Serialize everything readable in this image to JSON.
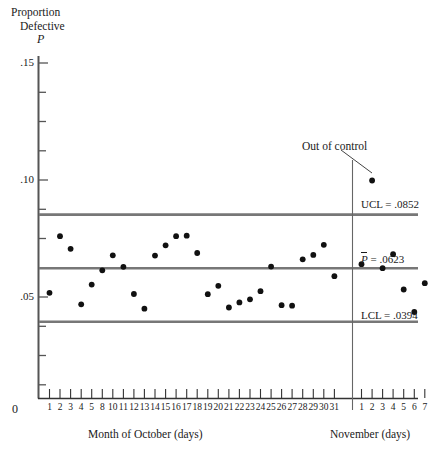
{
  "chart_data": {
    "type": "scatter",
    "title": "",
    "ylabel": "Proportion Defective P",
    "ylabel_lines": [
      "Proportion",
      "Defective",
      "P"
    ],
    "xlabel": "",
    "x_captions": [
      "Month of October (days)",
      "November (days)"
    ],
    "ylim": [
      0,
      0.165
    ],
    "y_ticks_labeled": [
      ".05",
      ".10",
      ".15"
    ],
    "y_tick_values": [
      0.05,
      0.1,
      0.15
    ],
    "y_minor_step": 0.0125,
    "origin_label": "0",
    "grid": false,
    "legend": "none",
    "annotations": [
      {
        "text": "Out of control",
        "points_to_index": 32,
        "value": 0.0998
      }
    ],
    "control_limits": [
      {
        "name": "UCL",
        "label": "UCL = .0852",
        "value": 0.0852
      },
      {
        "name": "CL",
        "label": "P = .0623",
        "prefix": "P",
        "suffix": " = .0623",
        "value": 0.0623
      },
      {
        "name": "LCL",
        "label": "LCL = .0394",
        "value": 0.0394
      }
    ],
    "october_tick_labels": [
      "1",
      "2",
      "3",
      "4",
      "5",
      "8",
      "10",
      "11",
      "12",
      "13",
      "14",
      "15",
      "16",
      "17",
      "18",
      "19",
      "20",
      "21",
      "22",
      "23",
      "24",
      "25",
      "26",
      "27",
      "28",
      "29",
      "30",
      "31"
    ],
    "november_tick_labels": [
      "1",
      "2",
      "3",
      "4",
      "5",
      "6",
      "7"
    ],
    "series": [
      {
        "name": "p",
        "october_values": [
          0.0518,
          0.076,
          0.0706,
          0.0469,
          0.0553,
          0.0614,
          0.0678,
          0.0629,
          0.0513,
          0.045,
          0.0677,
          0.0721,
          0.076,
          0.0762,
          0.0688,
          0.0512,
          0.0548,
          0.0455,
          0.0477,
          0.049,
          0.0525,
          0.063,
          0.0465,
          0.0463,
          0.0661,
          0.068,
          0.0723,
          0.0589
        ],
        "november_values": [
          0.064,
          0.0998,
          0.0623,
          0.0683,
          0.0532,
          0.0436,
          0.0559
        ]
      }
    ]
  },
  "layout": {
    "plot_left": 38,
    "plot_right": 418,
    "axis_bottom": 398,
    "axis_top": 60,
    "month_divider_x": 352
  }
}
